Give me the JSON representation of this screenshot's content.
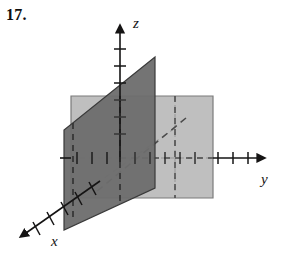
{
  "problem": {
    "number": "17."
  },
  "figure": {
    "caption_type": "3d-coordinate-planes-sketch",
    "axes": [
      {
        "id": "x",
        "label": "x",
        "label_x": 55,
        "label_y": 243,
        "direction": "down-left",
        "ticks": 6
      },
      {
        "id": "y",
        "label": "y",
        "label_x": 263,
        "label_y": 182,
        "direction": "right",
        "ticks": 11
      },
      {
        "id": "z",
        "label": "z",
        "label_x": 133,
        "label_y": 28,
        "direction": "up",
        "ticks": 7
      }
    ],
    "planes": [
      {
        "name": "dark-plane",
        "description": "vertical plane perpendicular to y-axis",
        "fill": "#6d6d6d",
        "points": "64,130 64,230 155,188 155,57"
      },
      {
        "name": "light-plane",
        "description": "vertical plane perpendicular to x-axis",
        "fill": "#b4b4b4",
        "points": "71,96 213,96 213,198 71,198"
      }
    ],
    "colors": {
      "ink": "#151414",
      "dark_plane": "#6d6d6d",
      "light_plane": "#b4b4b4",
      "dark_plane_edge": "#3a3a3a",
      "light_plane_edge": "#7b7b7b",
      "background": "#ffffff"
    },
    "origin": {
      "x": 120,
      "y": 158
    },
    "geometry": {
      "z_axis_top": {
        "x": 120,
        "y": 30
      },
      "z_axis_bottom": {
        "x": 120,
        "y": 162
      },
      "y_axis_start": {
        "x": 60,
        "y": 158
      },
      "y_axis_end": {
        "x": 256,
        "y": 158
      },
      "x_axis_start": {
        "x": 175,
        "y": 128
      },
      "x_axis_end": {
        "x": 24,
        "y": 235
      }
    }
  }
}
